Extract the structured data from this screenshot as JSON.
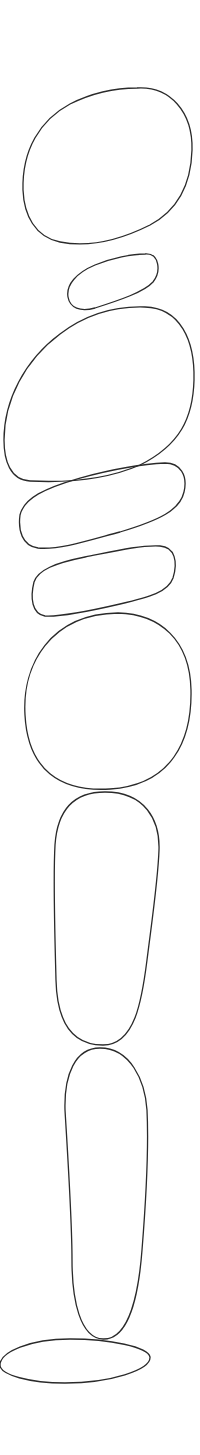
{
  "figure": {
    "background": "#ffffff",
    "stroke_color": "#2a2a2a",
    "stone_count": 9,
    "stones": [
      {
        "id": 1,
        "shape": "tilted-egg"
      },
      {
        "id": 2,
        "shape": "small-pebble"
      },
      {
        "id": 3,
        "shape": "large-tilted-egg"
      },
      {
        "id": 4,
        "shape": "flat-oval"
      },
      {
        "id": 5,
        "shape": "flat-rounded-rect"
      },
      {
        "id": 6,
        "shape": "round-boulder"
      },
      {
        "id": 7,
        "shape": "tall-capsule"
      },
      {
        "id": 8,
        "shape": "tall-tapered-capsule"
      },
      {
        "id": 9,
        "shape": "base-ellipse"
      }
    ]
  }
}
